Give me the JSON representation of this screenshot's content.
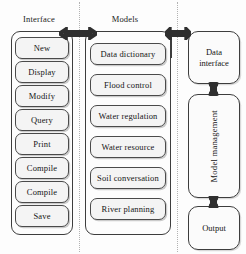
{
  "diagram": {
    "type": "block-diagram",
    "columns": [
      {
        "caption": "Interface",
        "name": "interface-column",
        "items": [
          {
            "label": "New"
          },
          {
            "label": "Display"
          },
          {
            "label": "Modify"
          },
          {
            "label": "Query"
          },
          {
            "label": "Print"
          },
          {
            "label": "Compile"
          },
          {
            "label": "Compile"
          },
          {
            "label": "Save"
          }
        ]
      },
      {
        "caption": "Models",
        "name": "models-column",
        "items": [
          {
            "label": "Data  dictionary"
          },
          {
            "label": "Flood control"
          },
          {
            "label": "Water regulation"
          },
          {
            "label": "Water  resource"
          },
          {
            "label": "Soil conversation"
          },
          {
            "label": "River planning"
          }
        ]
      },
      {
        "caption": "",
        "name": "management-column",
        "items": [
          {
            "label": "Data\ninterface",
            "line1": "Data",
            "line2": "interface"
          },
          {
            "label": "Model management"
          },
          {
            "label": "Output"
          }
        ]
      }
    ],
    "connectors": [
      {
        "name": "interface-models-arrow",
        "kind": "double-arrow-horizontal"
      },
      {
        "name": "models-data-interface-arrow",
        "kind": "double-arrow-horizontal"
      },
      {
        "name": "data-interface-model-management-arrow",
        "kind": "double-arrow-vertical"
      },
      {
        "name": "model-management-output-arrow",
        "kind": "double-arrow-vertical"
      }
    ],
    "colors": {
      "stroke": "#3d3d3d",
      "item_fill": "#f4f4f4",
      "divider": "#b2b2b2",
      "background": "#fdfdfd",
      "text": "#141414"
    }
  }
}
